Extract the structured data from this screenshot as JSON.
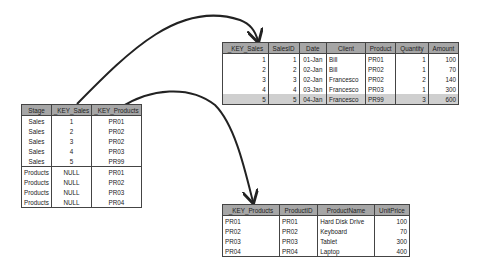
{
  "bridge_table": {
    "headers": [
      "Stage",
      "_KEY_Sales",
      "_KEY_Products"
    ],
    "rows": [
      [
        "Sales",
        "1",
        "PR01"
      ],
      [
        "Sales",
        "2",
        "PR02"
      ],
      [
        "Sales",
        "3",
        "PR02"
      ],
      [
        "Sales",
        "4",
        "PR03"
      ],
      [
        "Sales",
        "5",
        "PR99"
      ],
      [
        "Products",
        "NULL",
        "PR01"
      ],
      [
        "Products",
        "NULL",
        "PR02"
      ],
      [
        "Products",
        "NULL",
        "PR03"
      ],
      [
        "Products",
        "NULL",
        "PR04"
      ]
    ]
  },
  "sales_table": {
    "headers": [
      "_KEY_Sales",
      "SalesID",
      "Date",
      "Client",
      "Product",
      "Quantity",
      "Amount"
    ],
    "rows": [
      [
        "1",
        "1",
        "01-Jan",
        "Bill",
        "PR01",
        "1",
        "100"
      ],
      [
        "2",
        "2",
        "02-Jan",
        "Bill",
        "PR02",
        "1",
        "70"
      ],
      [
        "3",
        "3",
        "02-Jan",
        "Francesco",
        "PR02",
        "2",
        "140"
      ],
      [
        "4",
        "4",
        "03-Jan",
        "Francesco",
        "PR03",
        "1",
        "300"
      ],
      [
        "5",
        "5",
        "04-Jan",
        "Francesco",
        "PR99",
        "3",
        "600"
      ]
    ],
    "highlighted_row": 4
  },
  "products_table": {
    "headers": [
      "_KEY_Products",
      "ProductID",
      "ProductName",
      "UnitPrice"
    ],
    "rows": [
      [
        "PR01",
        "PR01",
        "Hard Disk Drive",
        "100"
      ],
      [
        "PR02",
        "PR02",
        "Keyboard",
        "70"
      ],
      [
        "PR03",
        "PR03",
        "Tablet",
        "300"
      ],
      [
        "PR04",
        "PR04",
        "Laptop",
        "400"
      ]
    ]
  },
  "arrows": [
    {
      "from": "bridge_table._KEY_Sales",
      "to": "sales_table._KEY_Sales"
    },
    {
      "from": "bridge_table._KEY_Products",
      "to": "products_table._KEY_Products"
    }
  ],
  "colors": {
    "header_bg": "#a6a6a6",
    "highlight_bg": "#cfcfcf",
    "border": "#444444",
    "arrow": "#222222"
  }
}
